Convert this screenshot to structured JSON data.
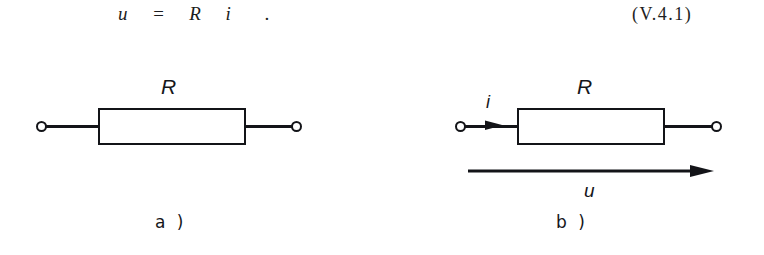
{
  "figure": {
    "equation": {
      "text": "u  =  R  i   .",
      "number": "(V.4.1)"
    },
    "panels": [
      {
        "id": "a",
        "caption": "a )",
        "component_label": "R",
        "terminals": 2,
        "has_current_arrow": false,
        "has_voltage_arrow": false
      },
      {
        "id": "b",
        "caption": "b )",
        "component_label": "R",
        "terminals": 2,
        "has_current_arrow": true,
        "current_label": "i",
        "has_voltage_arrow": true,
        "voltage_label": "u"
      }
    ],
    "colors": {
      "ink": "#131418",
      "background": "#ffffff"
    }
  }
}
